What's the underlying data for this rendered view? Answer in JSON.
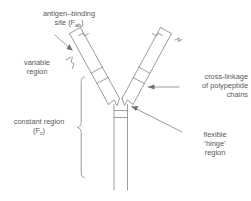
{
  "diagram": {
    "background_color": "#ffffff",
    "line_color": "#8a8a8d",
    "text_color": "#58585a",
    "labels": {
      "antigen_binding": {
        "line1": "antigen–binding",
        "line2_prefix": "site (F",
        "line2_sub": "ab",
        "line2_suffix": ")"
      },
      "variable_region": {
        "line1": "variable",
        "line2": "region"
      },
      "constant_region": {
        "line1": "constant region",
        "line2_prefix": "(F",
        "line2_sub": "c",
        "line2_suffix": ")"
      },
      "cross_linkage": {
        "line1": "cross-linkage",
        "line2": "of polypeptide",
        "line3": "chains"
      },
      "flexible_hinge": {
        "line1": "flexible",
        "line2": "‘hinge’",
        "line3": "region"
      }
    },
    "parts": {
      "left_arm": "left-antigen-binding-arm",
      "right_arm": "right-antigen-binding-arm",
      "stem": "constant-region-stem",
      "hinge": "flexible-hinge-region",
      "arm_cross_links": 2,
      "stem_cross_links": 2
    }
  }
}
